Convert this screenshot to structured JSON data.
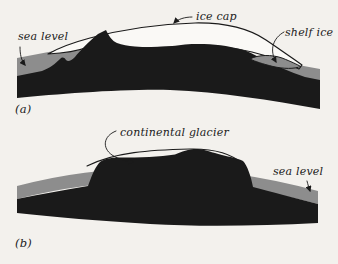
{
  "figure": {
    "colors": {
      "background": "#f3f1ed",
      "ink": "#1a1a1a",
      "sea": "#8d8d8d",
      "ice": "#faf9f6"
    },
    "panel_a": {
      "index_label": "(a)",
      "sea_level_label": "sea level",
      "ice_cap_label": "ice cap",
      "shelf_ice_label": "shelf ice"
    },
    "panel_b": {
      "index_label": "(b)",
      "glacier_label": "continental glacier",
      "sea_level_label": "sea level"
    }
  }
}
